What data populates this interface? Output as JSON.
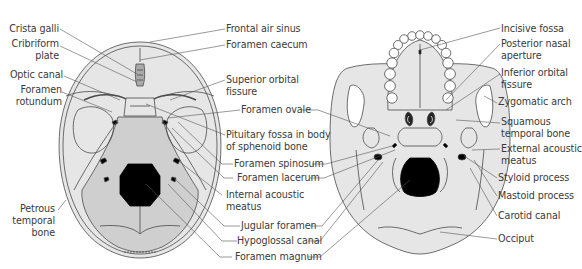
{
  "figure": {
    "left_view": {
      "name": "Internal base of skull (superior view)",
      "labels_left": [
        {
          "id": "crista-galli",
          "text": "Crista galli"
        },
        {
          "id": "cribriform-plate",
          "text": "Cribriform\nplate",
          "line1": "Cribriform",
          "line2": "plate"
        },
        {
          "id": "optic-canal",
          "text": "Optic canal"
        },
        {
          "id": "foramen-rotundum",
          "line1": "Foramen",
          "line2": "rotundum"
        },
        {
          "id": "petrous-temporal-bone",
          "line1": "Petrous",
          "line2": "temporal",
          "line3": "bone"
        }
      ],
      "labels_right": [
        {
          "id": "frontal-air-sinus",
          "text": "Frontal air sinus"
        },
        {
          "id": "foramen-caecum",
          "text": "Foramen caecum"
        },
        {
          "id": "superior-orbital-fissure",
          "line1": "Superior orbital",
          "line2": "fissure"
        },
        {
          "id": "foramen-ovale",
          "text": "Foramen ovale"
        },
        {
          "id": "pituitary-fossa",
          "line1": "Pituitary fossa in body",
          "line2": "of sphenoid bone"
        },
        {
          "id": "foramen-spinosum",
          "text": "Foramen spinosum"
        },
        {
          "id": "foramen-lacerum",
          "text": "Foramen lacerum"
        },
        {
          "id": "internal-acoustic-meatus",
          "line1": "Internal acoustic",
          "line2": "meatus"
        },
        {
          "id": "jugular-foramen",
          "text": "Jugular foramen"
        },
        {
          "id": "hypoglossal-canal",
          "text": "Hypoglossal canal"
        },
        {
          "id": "foramen-magnum",
          "text": "Foramen magnum"
        }
      ]
    },
    "right_view": {
      "name": "External base of skull (inferior view)",
      "labels_right": [
        {
          "id": "incisive-fossa",
          "text": "Incisive fossa"
        },
        {
          "id": "posterior-nasal-aperture",
          "line1": "Posterior nasal",
          "line2": "aperture"
        },
        {
          "id": "inferior-orbital-fissure",
          "line1": "Inferior orbital",
          "line2": "fissure"
        },
        {
          "id": "zygomatic-arch",
          "text": "Zygomatic arch"
        },
        {
          "id": "squamous-temporal-bone",
          "line1": "Squamous",
          "line2": "temporal bone"
        },
        {
          "id": "external-acoustic-meatus",
          "line1": "External acoustic",
          "line2": "meatus"
        },
        {
          "id": "styloid-process",
          "text": "Styloid process"
        },
        {
          "id": "mastoid-process",
          "text": "Mastoid process"
        },
        {
          "id": "carotid-canal",
          "text": "Carotid canal"
        },
        {
          "id": "occiput",
          "text": "Occiput"
        }
      ]
    },
    "colors": {
      "skull_fill": "#e6e6e6",
      "posterior_fossa_fill": "#cfcfcf",
      "outline": "#4a4a4a",
      "foramen_fill": "#000000",
      "label_text": "#3a3a3a",
      "leader_line": "#555555"
    }
  }
}
